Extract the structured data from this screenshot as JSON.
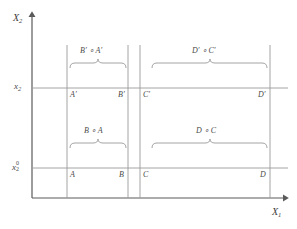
{
  "figure": {
    "background_color": "#ffffff",
    "line_color": "#8a8a8a",
    "text_color": "#4a4a4a",
    "axes": {
      "x_axis_label": "X",
      "x_axis_sub": "1",
      "y_axis_label": "X",
      "y_axis_sub": "2"
    },
    "ticks": [
      {
        "id": "upper",
        "base": "x",
        "sub": "2",
        "sup": "",
        "value_y": 88
      },
      {
        "id": "lower",
        "base": "x",
        "sub": "2",
        "sup": "0",
        "value_y": 168
      }
    ],
    "vertical_lines": [
      {
        "id": "line-A",
        "x": 67
      },
      {
        "id": "line-B",
        "x": 128
      },
      {
        "id": "line-C",
        "x": 140
      },
      {
        "id": "line-D",
        "x": 270
      }
    ],
    "horizontal_lines": [
      {
        "id": "hline-x2",
        "y": 88
      },
      {
        "id": "hline-x2-zero",
        "y": 168
      }
    ],
    "point_labels": [
      {
        "id": "A-prime",
        "text": "A′",
        "x": 70,
        "y": 91
      },
      {
        "id": "B-prime",
        "text": "B′",
        "x": 118,
        "y": 91
      },
      {
        "id": "C-prime",
        "text": "C′",
        "x": 143,
        "y": 91
      },
      {
        "id": "D-prime",
        "text": "D′",
        "x": 258,
        "y": 91
      },
      {
        "id": "A",
        "text": "A",
        "x": 70,
        "y": 171
      },
      {
        "id": "B",
        "text": "B",
        "x": 119,
        "y": 171
      },
      {
        "id": "C",
        "text": "C",
        "x": 143,
        "y": 171
      },
      {
        "id": "D",
        "text": "D",
        "x": 260,
        "y": 171
      }
    ],
    "brackets": [
      {
        "id": "bracket-upper-left",
        "label": "B′ ∘ A′",
        "x_start": 70,
        "x_end": 126,
        "y": 63,
        "label_x": 98,
        "label_y": 48
      },
      {
        "id": "bracket-upper-right",
        "label": "D′ ∘ C′",
        "x_start": 152,
        "x_end": 267,
        "y": 63,
        "label_x": 210,
        "label_y": 48
      },
      {
        "id": "bracket-lower-left",
        "label": "B ∘ A",
        "x_start": 70,
        "x_end": 126,
        "y": 143,
        "label_x": 98,
        "label_y": 128
      },
      {
        "id": "bracket-lower-right",
        "label": "D ∘ C",
        "x_start": 152,
        "x_end": 267,
        "y": 143,
        "label_x": 210,
        "label_y": 128
      }
    ]
  }
}
